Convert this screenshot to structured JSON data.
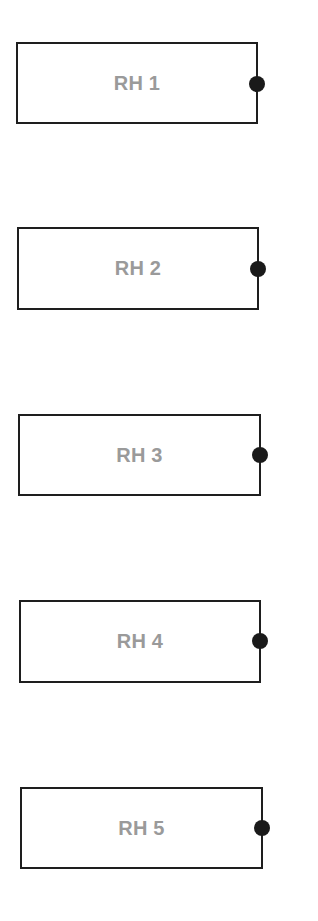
{
  "diagram": {
    "colors": {
      "stroke": "#1e1e1e",
      "label": "#9a9a9a",
      "dot": "#1a1a1a",
      "background": "#ffffff"
    },
    "boxes": [
      {
        "label": "RH 1",
        "left": 16,
        "top": 42,
        "width": 242,
        "height": 82,
        "dot_y": 84
      },
      {
        "label": "RH 2",
        "left": 17,
        "top": 227,
        "width": 242,
        "height": 83,
        "dot_y": 269
      },
      {
        "label": "RH 3",
        "left": 18,
        "top": 414,
        "width": 243,
        "height": 82,
        "dot_y": 455
      },
      {
        "label": "RH 4",
        "left": 19,
        "top": 600,
        "width": 242,
        "height": 83,
        "dot_y": 641
      },
      {
        "label": "RH 5",
        "left": 20,
        "top": 787,
        "width": 243,
        "height": 82,
        "dot_y": 828
      }
    ]
  }
}
